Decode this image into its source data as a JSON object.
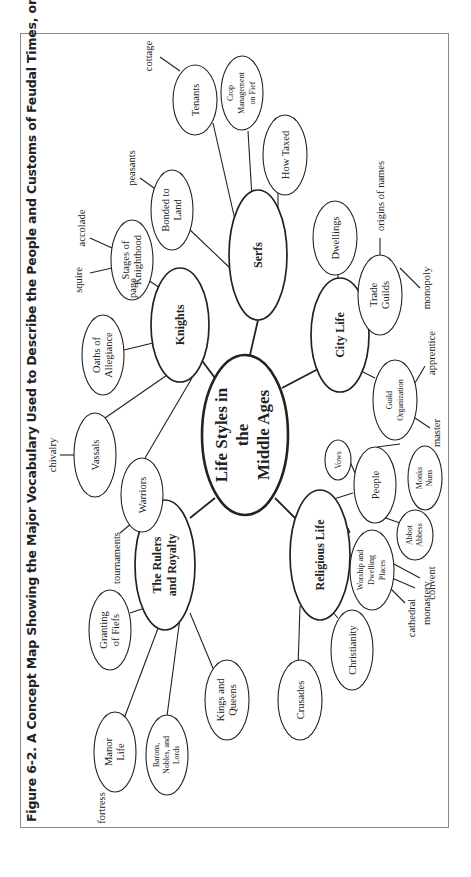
{
  "figure": {
    "title": "Figure 6-2. A Concept Map Showing the Major Vocabulary Used to Describe the People and Customs of Feudal Times, or the Middle Ages",
    "orientation": "rotated -90 degrees (landscape page)"
  },
  "center": {
    "lines": [
      "Life Styles in",
      "the",
      "Middle Ages"
    ]
  },
  "categories": {
    "serfs": {
      "label": "Serfs"
    },
    "knights": {
      "label": "Knights"
    },
    "city_life": {
      "label": "City Life"
    },
    "religious_life": {
      "label": "Religious Life"
    },
    "rulers": {
      "lines": [
        "The Rulers",
        "and Royalty"
      ]
    }
  },
  "subtopics": {
    "tenants": {
      "lines": [
        "Tenants"
      ]
    },
    "crop": {
      "lines": [
        "Crop",
        "Management",
        "on Fief"
      ]
    },
    "how_taxed": {
      "lines": [
        "How Taxed"
      ]
    },
    "bonded": {
      "lines": [
        "Bonded to",
        "Land"
      ]
    },
    "stages": {
      "lines": [
        "Stages of",
        "Knighthood"
      ]
    },
    "oaths": {
      "lines": [
        "Oaths of",
        "Allegiance"
      ]
    },
    "vassals": {
      "lines": [
        "Vassals"
      ]
    },
    "warriors": {
      "lines": [
        "Warriors"
      ]
    },
    "granting": {
      "lines": [
        "Granting",
        "of Fiefs"
      ]
    },
    "manor": {
      "lines": [
        "Manor",
        "Life"
      ]
    },
    "barons": {
      "lines": [
        "Barons,",
        "Nobles, and",
        "Lords"
      ]
    },
    "kings": {
      "lines": [
        "Kings and",
        "Queens"
      ]
    },
    "crusades": {
      "lines": [
        "Crusades"
      ]
    },
    "christianity": {
      "lines": [
        "Christianity"
      ]
    },
    "worship": {
      "lines": [
        "Worship and",
        "Dwelling",
        "Places"
      ]
    },
    "abbot": {
      "lines": [
        "Abbot",
        "Abbess"
      ]
    },
    "people": {
      "lines": [
        "People"
      ]
    },
    "monks": {
      "lines": [
        "Monks",
        "Nuns"
      ]
    },
    "vows": {
      "lines": [
        "Vows"
      ]
    },
    "guild_org": {
      "lines": [
        "Guild",
        "Organization"
      ]
    },
    "trade_guilds": {
      "lines": [
        "Trade",
        "Guilds"
      ]
    },
    "dwellings": {
      "lines": [
        "Dwellings"
      ]
    }
  },
  "vocabulary": {
    "cottage": "cottage",
    "peasants": "peasants",
    "accolade": "accolade",
    "squire": "squire",
    "page": "page",
    "chivalry": "chivalry",
    "tournaments": "tournaments",
    "fortress": "fortress",
    "cathedral": "cathedral",
    "monastery": "monastery",
    "convent": "convent",
    "master": "master",
    "apprentice": "apprentice",
    "monopoly": "monopoly",
    "origins_of_names": "origins of names"
  }
}
